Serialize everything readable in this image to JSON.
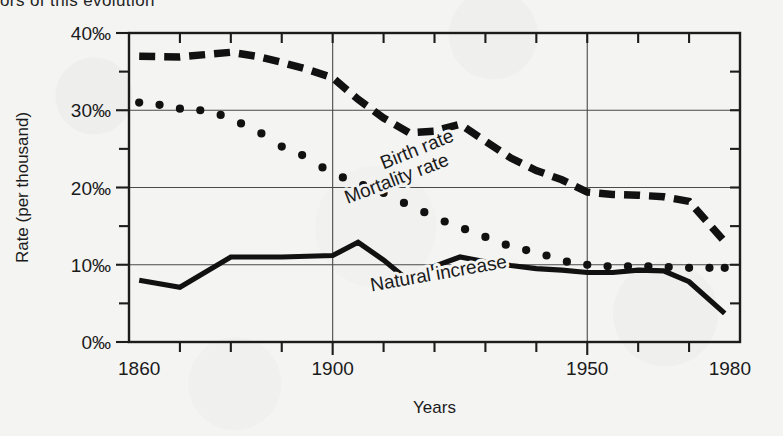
{
  "page": {
    "clipped_heading": "ors of this evolution"
  },
  "chart_data": {
    "type": "line",
    "title": "",
    "xlabel": "Years",
    "ylabel": "Rate (per thousand)",
    "xlim": [
      1860,
      1980
    ],
    "ylim": [
      0,
      40
    ],
    "xticks": [
      1860,
      1870,
      1880,
      1890,
      1900,
      1910,
      1920,
      1930,
      1940,
      1950,
      1960,
      1970,
      1980
    ],
    "xtick_labels": [
      "1860",
      "",
      "",
      "",
      "1900",
      "",
      "",
      "",
      "",
      "1950",
      "",
      "",
      "1980"
    ],
    "yticks": [
      0,
      5,
      10,
      15,
      20,
      25,
      30,
      35,
      40
    ],
    "ytick_labels": [
      "0‰",
      "",
      "10‰",
      "",
      "20‰",
      "",
      "30‰",
      "",
      "40‰"
    ],
    "gridlines": {
      "x": [
        1900,
        1950
      ],
      "y": [
        10,
        20,
        30
      ]
    },
    "legend_position": "inline-on-curves",
    "series": [
      {
        "name": "Birth rate",
        "style": "dashed",
        "label_x": 1917,
        "label_y": 24.2,
        "label_rotation": -22,
        "x": [
          1862,
          1870,
          1875,
          1880,
          1885,
          1890,
          1895,
          1900,
          1905,
          1910,
          1915,
          1920,
          1925,
          1930,
          1935,
          1940,
          1945,
          1950,
          1955,
          1960,
          1965,
          1970,
          1977
        ],
        "y": [
          37.0,
          36.9,
          37.2,
          37.5,
          37.0,
          36.2,
          35.3,
          34.2,
          31.4,
          29.0,
          27.1,
          27.3,
          28.2,
          26.0,
          23.8,
          22.2,
          21.0,
          19.4,
          19.1,
          19.0,
          18.8,
          18.2,
          13.0
        ]
      },
      {
        "name": "Mortality rate",
        "style": "dotted",
        "label_x": 1913,
        "label_y": 20.4,
        "label_rotation": -21,
        "x": [
          1862,
          1866,
          1870,
          1874,
          1878,
          1882,
          1886,
          1890,
          1894,
          1898,
          1902,
          1906,
          1910,
          1914,
          1918,
          1922,
          1926,
          1930,
          1934,
          1938,
          1942,
          1946,
          1950,
          1954,
          1958,
          1962,
          1966,
          1970,
          1974,
          1977
        ],
        "y": [
          31.0,
          30.7,
          30.2,
          30.0,
          29.4,
          28.3,
          27.0,
          25.3,
          24.2,
          22.6,
          21.3,
          20.3,
          19.3,
          18.0,
          16.8,
          15.6,
          14.6,
          13.6,
          12.6,
          11.9,
          11.2,
          10.4,
          10.0,
          9.8,
          9.8,
          9.8,
          9.7,
          9.6,
          9.6,
          9.6
        ]
      },
      {
        "name": "Natural increase",
        "style": "solid",
        "label_x": 1921,
        "label_y": 8.1,
        "label_rotation": -10,
        "x": [
          1862,
          1870,
          1880,
          1890,
          1900,
          1905,
          1910,
          1915,
          1920,
          1925,
          1930,
          1935,
          1940,
          1945,
          1950,
          1955,
          1960,
          1965,
          1970,
          1977
        ],
        "y": [
          8.0,
          7.1,
          11.0,
          11.0,
          11.2,
          12.9,
          10.6,
          7.9,
          9.8,
          11.0,
          10.4,
          9.9,
          9.5,
          9.3,
          9.0,
          9.0,
          9.3,
          9.2,
          7.8,
          3.7
        ]
      }
    ]
  }
}
